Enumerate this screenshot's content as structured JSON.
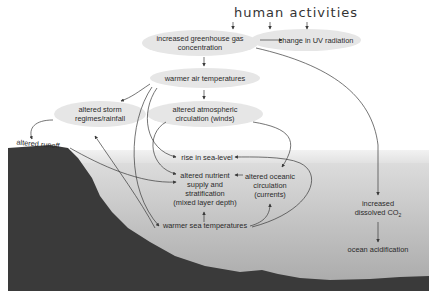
{
  "title": "human activities",
  "colors": {
    "sky": "#ffffff",
    "bubble": "#e6e6e6",
    "sea_top": "#dcdcdc",
    "sea_mid": "#c4c4c4",
    "sea_deep": "#a8a8a8",
    "land": "#3a3a3a",
    "arrow": "#3a3a3a"
  },
  "nodes": {
    "greenhouse": "increased greenhouse gas concentration",
    "greenhouse_l1": "increased greenhouse gas",
    "greenhouse_l2": "concentration",
    "uv": "change in UV radiation",
    "air_temp": "warmer air temperatures",
    "storm_l1": "altered storm",
    "storm_l2": "regimes/rainfall",
    "atmos_l1": "altered atmospheric",
    "atmos_l2": "circulation (winds)",
    "runoff": "altered runoff",
    "sea_level": "rise in sea-level",
    "nutrient_l1": "altered nutrient",
    "nutrient_l2": "supply and",
    "nutrient_l3": "stratification",
    "nutrient_l4": "(mixed layer depth)",
    "oceanic_l1": "altered oceanic",
    "oceanic_l2": "circulation",
    "oceanic_l3": "(currents)",
    "sea_temp": "warmer sea temperatures",
    "co2_l1": "increased",
    "co2_l2": "dissolved CO",
    "co2_sub": "2",
    "acidification": "ocean acidification"
  }
}
